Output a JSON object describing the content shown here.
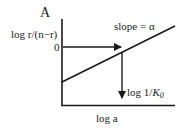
{
  "panel_label": "A",
  "y_axis_label": "log r/(n−r)",
  "x_axis_label": "log a",
  "zero_tick": "0",
  "slope_label": "slope = α",
  "intercept_label": {
    "prefix": "log 1/",
    "var": "K",
    "sub": "0"
  },
  "colors": {
    "line": "#1a1a1a",
    "text": "#222222",
    "background": "#ffffff"
  }
}
